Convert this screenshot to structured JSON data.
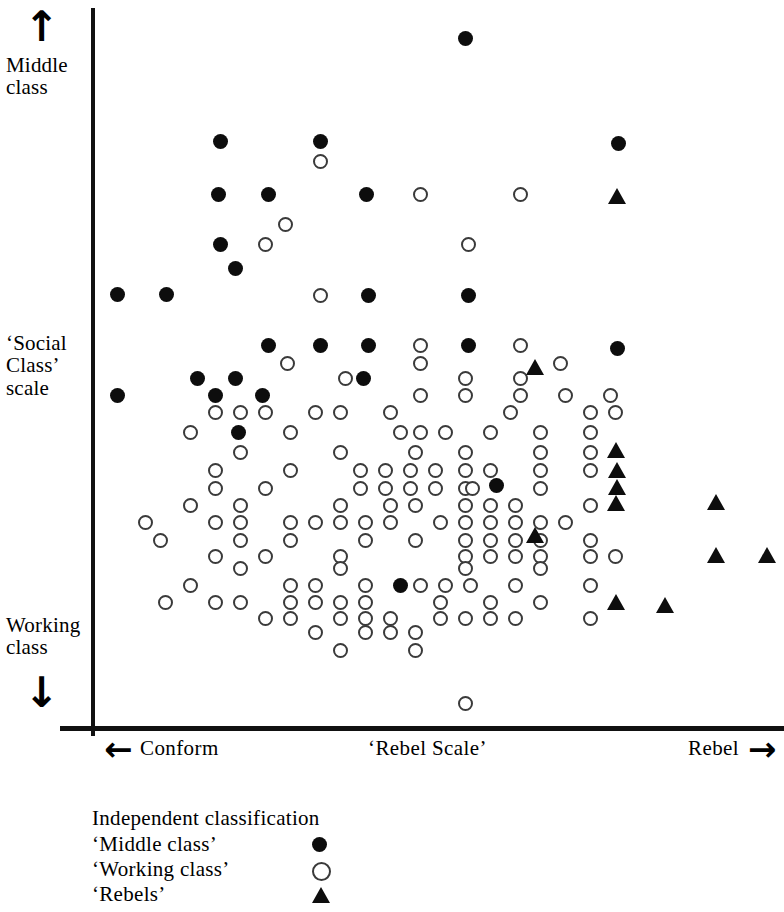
{
  "figure": {
    "axes": {
      "y_label_top": "Middle\nclass",
      "y_label_middle": "‘Social\nClass’\nscale",
      "y_label_bottom": "Working\nclass",
      "x_label_left": "Conform",
      "x_label_center": "‘Rebel Scale’",
      "x_label_right": "Rebel",
      "arrow_up": "↑",
      "arrow_down": "↓",
      "arrow_left": "←",
      "arrow_right": "→"
    },
    "legend": {
      "title": "Independent  classification",
      "items": [
        {
          "label": "‘Middle  class’",
          "marker": "filled-circle"
        },
        {
          "label": "‘Working  class’",
          "marker": "open-circle"
        },
        {
          "label": "‘Rebels’",
          "marker": "filled-triangle"
        }
      ]
    }
  },
  "chart_data": {
    "type": "scatter",
    "title": "",
    "xlabel": "‘Rebel Scale’",
    "ylabel": "‘Social Class’ scale",
    "xlabel_low": "Conform",
    "xlabel_high": "Rebel",
    "ylabel_high": "Middle class",
    "ylabel_low": "Working class",
    "grid": false,
    "axis_ticks": false,
    "legend_position": "below-axis-left",
    "note": "Point coordinates are given in screenshot pixel space: x increases toward 'Rebel', y increases downward toward 'Working class'. Plot area spans x 93-784 px, y 8-728 px.",
    "pixel_space": {
      "x_axis_px": [
        93,
        784
      ],
      "y_axis_px": [
        8,
        728
      ],
      "y_direction": "down-is-working-class"
    },
    "series": [
      {
        "name": "‘Middle class’",
        "marker": "filled-circle",
        "count": 26,
        "points": [
          [
            465,
            38
          ],
          [
            220,
            141
          ],
          [
            320,
            141
          ],
          [
            618,
            143
          ],
          [
            218,
            194
          ],
          [
            268,
            194
          ],
          [
            366,
            194
          ],
          [
            220,
            244
          ],
          [
            235,
            268
          ],
          [
            117,
            294
          ],
          [
            166,
            294
          ],
          [
            368,
            295
          ],
          [
            468,
            295
          ],
          [
            268,
            345
          ],
          [
            320,
            345
          ],
          [
            368,
            345
          ],
          [
            468,
            345
          ],
          [
            617,
            348
          ],
          [
            197,
            378
          ],
          [
            235,
            378
          ],
          [
            117,
            395
          ],
          [
            215,
            395
          ],
          [
            262,
            395
          ],
          [
            363,
            378
          ],
          [
            238,
            432
          ],
          [
            496,
            485
          ],
          [
            400,
            585
          ]
        ]
      },
      {
        "name": "‘Working class’",
        "marker": "open-circle",
        "count": 180,
        "points": [
          [
            320,
            161
          ],
          [
            420,
            194
          ],
          [
            520,
            194
          ],
          [
            285,
            224
          ],
          [
            265,
            244
          ],
          [
            468,
            244
          ],
          [
            320,
            295
          ],
          [
            420,
            345
          ],
          [
            520,
            345
          ],
          [
            287,
            363
          ],
          [
            420,
            363
          ],
          [
            560,
            363
          ],
          [
            345,
            378
          ],
          [
            465,
            378
          ],
          [
            520,
            378
          ],
          [
            420,
            395
          ],
          [
            465,
            395
          ],
          [
            520,
            395
          ],
          [
            565,
            395
          ],
          [
            610,
            395
          ],
          [
            215,
            412
          ],
          [
            240,
            412
          ],
          [
            265,
            412
          ],
          [
            315,
            412
          ],
          [
            340,
            412
          ],
          [
            390,
            412
          ],
          [
            510,
            412
          ],
          [
            590,
            412
          ],
          [
            615,
            412
          ],
          [
            190,
            432
          ],
          [
            290,
            432
          ],
          [
            400,
            432
          ],
          [
            420,
            432
          ],
          [
            445,
            432
          ],
          [
            490,
            432
          ],
          [
            540,
            432
          ],
          [
            590,
            432
          ],
          [
            240,
            452
          ],
          [
            340,
            452
          ],
          [
            415,
            452
          ],
          [
            465,
            452
          ],
          [
            540,
            452
          ],
          [
            590,
            452
          ],
          [
            215,
            470
          ],
          [
            290,
            470
          ],
          [
            360,
            470
          ],
          [
            385,
            470
          ],
          [
            410,
            470
          ],
          [
            435,
            470
          ],
          [
            465,
            470
          ],
          [
            490,
            470
          ],
          [
            540,
            470
          ],
          [
            590,
            470
          ],
          [
            215,
            488
          ],
          [
            265,
            488
          ],
          [
            360,
            488
          ],
          [
            385,
            488
          ],
          [
            410,
            488
          ],
          [
            435,
            488
          ],
          [
            465,
            488
          ],
          [
            472,
            488
          ],
          [
            540,
            488
          ],
          [
            190,
            505
          ],
          [
            240,
            505
          ],
          [
            340,
            505
          ],
          [
            390,
            505
          ],
          [
            415,
            505
          ],
          [
            465,
            505
          ],
          [
            490,
            505
          ],
          [
            515,
            505
          ],
          [
            590,
            505
          ],
          [
            145,
            522
          ],
          [
            215,
            522
          ],
          [
            240,
            522
          ],
          [
            290,
            522
          ],
          [
            315,
            522
          ],
          [
            340,
            522
          ],
          [
            365,
            522
          ],
          [
            390,
            522
          ],
          [
            440,
            522
          ],
          [
            465,
            522
          ],
          [
            490,
            522
          ],
          [
            515,
            522
          ],
          [
            540,
            522
          ],
          [
            565,
            522
          ],
          [
            160,
            540
          ],
          [
            240,
            540
          ],
          [
            290,
            540
          ],
          [
            365,
            540
          ],
          [
            415,
            540
          ],
          [
            465,
            540
          ],
          [
            490,
            540
          ],
          [
            515,
            540
          ],
          [
            540,
            540
          ],
          [
            590,
            540
          ],
          [
            215,
            556
          ],
          [
            265,
            556
          ],
          [
            340,
            556
          ],
          [
            465,
            556
          ],
          [
            490,
            556
          ],
          [
            515,
            556
          ],
          [
            540,
            556
          ],
          [
            590,
            556
          ],
          [
            615,
            556
          ],
          [
            240,
            568
          ],
          [
            340,
            568
          ],
          [
            465,
            568
          ],
          [
            540,
            568
          ],
          [
            190,
            585
          ],
          [
            290,
            585
          ],
          [
            315,
            585
          ],
          [
            365,
            585
          ],
          [
            420,
            585
          ],
          [
            445,
            585
          ],
          [
            470,
            585
          ],
          [
            515,
            585
          ],
          [
            590,
            585
          ],
          [
            165,
            602
          ],
          [
            215,
            602
          ],
          [
            240,
            602
          ],
          [
            290,
            602
          ],
          [
            315,
            602
          ],
          [
            340,
            602
          ],
          [
            365,
            602
          ],
          [
            440,
            602
          ],
          [
            490,
            602
          ],
          [
            540,
            602
          ],
          [
            265,
            618
          ],
          [
            290,
            618
          ],
          [
            340,
            618
          ],
          [
            365,
            618
          ],
          [
            390,
            618
          ],
          [
            440,
            618
          ],
          [
            465,
            618
          ],
          [
            490,
            618
          ],
          [
            515,
            618
          ],
          [
            590,
            618
          ],
          [
            315,
            632
          ],
          [
            365,
            632
          ],
          [
            390,
            632
          ],
          [
            415,
            632
          ],
          [
            340,
            650
          ],
          [
            415,
            650
          ],
          [
            465,
            703
          ]
        ]
      },
      {
        "name": "‘Rebels’",
        "marker": "filled-triangle",
        "count": 11,
        "points": [
          [
            617,
            196
          ],
          [
            535,
            367
          ],
          [
            616,
            450
          ],
          [
            617,
            470
          ],
          [
            617,
            487
          ],
          [
            616,
            503
          ],
          [
            535,
            535
          ],
          [
            716,
            502
          ],
          [
            716,
            555
          ],
          [
            767,
            555
          ],
          [
            616,
            602
          ],
          [
            665,
            605
          ]
        ]
      }
    ]
  }
}
